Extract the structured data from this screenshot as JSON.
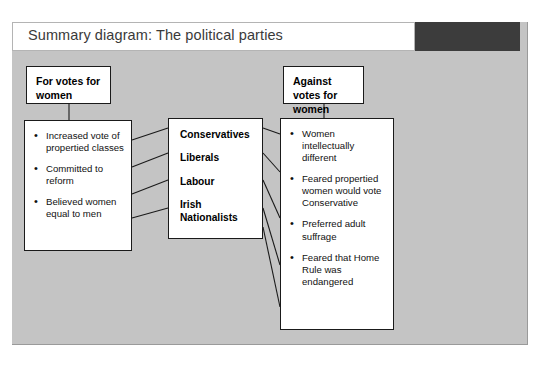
{
  "header": {
    "title": "Summary diagram: The political parties"
  },
  "colors": {
    "panel_background": "#c4c4c4",
    "title_bar_white": "#ffffff",
    "title_bar_dark": "#3c3c3c",
    "box_background": "#ffffff",
    "box_border": "#1a1a1a",
    "text": "#111111"
  },
  "nodes": {
    "for_header": {
      "label": "For votes for women"
    },
    "against_header": {
      "label": "Against votes for women"
    },
    "for_points": {
      "items": [
        "Increased vote of propertied classes",
        "Committed to reform",
        "Believed women equal to men"
      ]
    },
    "parties": {
      "items": [
        "Conservatives",
        "Liberals",
        "Labour",
        "Irish Nationalists"
      ]
    },
    "against_points": {
      "items": [
        "Women intellectually different",
        "Feared propertied women would vote Conservative",
        "Preferred adult suffrage",
        "Feared that Home Rule was endangered"
      ]
    }
  }
}
